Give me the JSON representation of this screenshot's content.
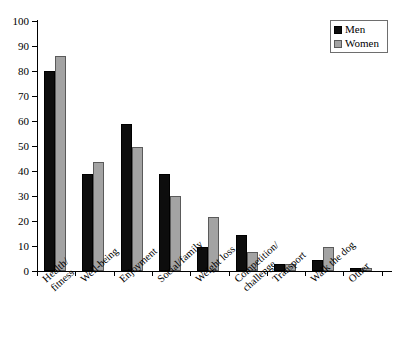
{
  "chart_data": {
    "type": "bar",
    "title": "",
    "subtitle": "",
    "xlabel": "",
    "ylabel": "",
    "ylim": [
      0,
      100
    ],
    "ytick_step": 10,
    "grid": false,
    "legend_position": "top-right",
    "categories": [
      "Health/ fitness",
      "Well-being",
      "Enjoyment",
      "Social/family",
      "Weight loss",
      "Competition/ challenge",
      "Transport",
      "Walk the dog",
      "Other"
    ],
    "category_lines": [
      [
        "Health/",
        "fitness"
      ],
      [
        "Well-being",
        ""
      ],
      [
        "Enjoyment",
        ""
      ],
      [
        "Social/family",
        ""
      ],
      [
        "Weight loss",
        ""
      ],
      [
        "Competition/",
        "challenge"
      ],
      [
        "Transport",
        ""
      ],
      [
        "Walk the dog",
        ""
      ],
      [
        "Other",
        ""
      ]
    ],
    "yticks": [
      0,
      10,
      20,
      30,
      40,
      50,
      60,
      70,
      80,
      90,
      100
    ],
    "series": [
      {
        "name": "Men",
        "color": "#0d0d0d",
        "values": [
          80,
          39,
          59,
          39,
          9.5,
          14.5,
          3,
          4.5,
          1.3
        ]
      },
      {
        "name": "Women",
        "color": "#a3a3a3",
        "values": [
          86,
          43.5,
          49.5,
          30,
          21.5,
          7.5,
          3,
          9.5,
          1.3
        ]
      }
    ]
  },
  "legend": {
    "items": [
      {
        "label": "Men",
        "color": "#0d0d0d"
      },
      {
        "label": "Women",
        "color": "#a3a3a3"
      }
    ]
  },
  "axes": {
    "y": {
      "labels": [
        "100",
        "90",
        "80",
        "70",
        "60",
        "50",
        "40",
        "30",
        "20",
        "10",
        "0"
      ]
    }
  }
}
